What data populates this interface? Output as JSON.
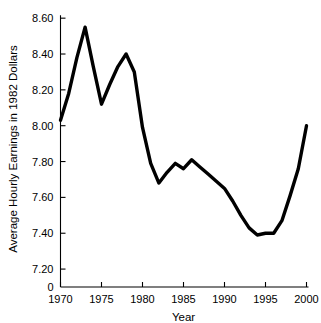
{
  "chart_data": {
    "type": "line",
    "title": "",
    "xlabel": "Year",
    "ylabel": "Average Hourly Earnings in 1982 Dollars",
    "xlim": [
      1970,
      2000
    ],
    "ylim": [
      7.1,
      8.64
    ],
    "grid": false,
    "legend": "none",
    "axis_break": true,
    "origin_label": "0",
    "line_color": "#000000",
    "background_color": "#ffffff",
    "xticks": [
      1970,
      1975,
      1980,
      1985,
      1990,
      1995,
      2000
    ],
    "xtick_labels": [
      "1970",
      "1975",
      "1980",
      "1985",
      "1990",
      "1995",
      "2000"
    ],
    "yticks": [
      7.2,
      7.4,
      7.6,
      7.8,
      8.0,
      8.2,
      8.4,
      8.6
    ],
    "ytick_labels": [
      "7.20",
      "7.40",
      "7.60",
      "7.80",
      "8.00",
      "8.20",
      "8.40",
      "8.60"
    ],
    "x": [
      1970,
      1971,
      1972,
      1973,
      1974,
      1975,
      1976,
      1977,
      1978,
      1979,
      1980,
      1981,
      1982,
      1983,
      1984,
      1985,
      1986,
      1987,
      1988,
      1989,
      1990,
      1991,
      1992,
      1993,
      1994,
      1995,
      1996,
      1997,
      1998,
      1999,
      2000
    ],
    "values": [
      8.03,
      8.18,
      8.38,
      8.55,
      8.33,
      8.12,
      8.23,
      8.33,
      8.4,
      8.3,
      7.99,
      7.79,
      7.68,
      7.74,
      7.79,
      7.76,
      7.81,
      7.77,
      7.73,
      7.69,
      7.65,
      7.58,
      7.5,
      7.43,
      7.39,
      7.4,
      7.4,
      7.47,
      7.61,
      7.76,
      8.0
    ],
    "series": [
      {
        "name": "Average hourly earnings",
        "values": [
          8.03,
          8.18,
          8.38,
          8.55,
          8.33,
          8.12,
          8.23,
          8.33,
          8.4,
          8.3,
          7.99,
          7.79,
          7.68,
          7.74,
          7.79,
          7.76,
          7.81,
          7.77,
          7.73,
          7.69,
          7.65,
          7.58,
          7.5,
          7.43,
          7.39,
          7.4,
          7.4,
          7.47,
          7.61,
          7.76,
          8.0
        ]
      }
    ]
  }
}
